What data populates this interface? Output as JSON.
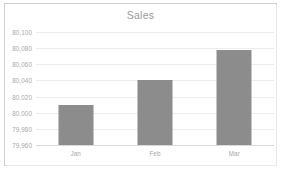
{
  "chart_data": {
    "type": "bar",
    "title": "Sales",
    "xlabel": "",
    "ylabel": "",
    "categories": [
      "Jan",
      "Feb",
      "Mar"
    ],
    "values": [
      80010,
      80040,
      80078
    ],
    "series": [
      {
        "name": "Sales",
        "values": [
          80010,
          80040,
          80078
        ]
      }
    ],
    "ylim": [
      79960,
      80100
    ],
    "ytick_values": [
      79960,
      79980,
      80000,
      80020,
      80040,
      80060,
      80080,
      80100
    ],
    "ytick_labels": [
      "79,960",
      "79,980",
      "80,000",
      "80,020",
      "80,040",
      "80,060",
      "80,080",
      "80,100"
    ],
    "grid": true,
    "legend": false,
    "legend_position": "none",
    "bar_color": "#8c8c8c",
    "gridline_color": "#ececec",
    "axis_color": "#d9d9d9",
    "text_color": "#a8a8a8",
    "title_color": "#9b9b9b",
    "background_color": "#ffffff",
    "border_color": "#d0d0d0"
  }
}
